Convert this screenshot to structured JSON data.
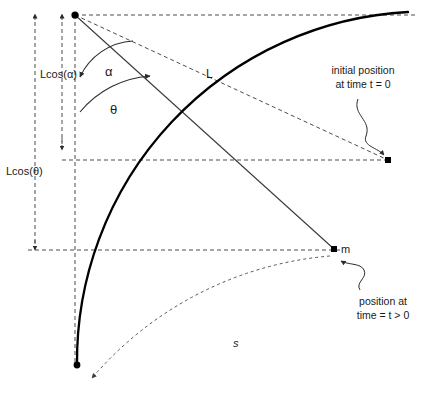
{
  "figure": {
    "type": "physics-diagram",
    "background_color": "#ffffff",
    "line_color": "#3a3a3a",
    "arc_color": "#000000",
    "text_color": "#1a1a1a",
    "width": 426,
    "height": 396
  },
  "labels": {
    "lcos_alpha": "Lcos(α)",
    "lcos_theta": "Lcos(θ)",
    "alpha": "α",
    "theta": "θ",
    "length": "L",
    "mass": "m",
    "arc_length": "s"
  },
  "annotations": {
    "initial_position": {
      "line1": "initial position",
      "line2": "at time t = 0"
    },
    "current_position": {
      "line1": "position at",
      "line2": "time = t > 0"
    }
  },
  "geometry": {
    "pivot": {
      "x": 75,
      "y": 15
    },
    "initial_bob": {
      "x": 388,
      "y": 160
    },
    "current_bob": {
      "x": 334,
      "y": 249
    },
    "rest_bob": {
      "x": 77,
      "y": 365
    },
    "radius_L": 350,
    "angle_alpha_deg": 67,
    "angle_theta_deg": 46
  }
}
